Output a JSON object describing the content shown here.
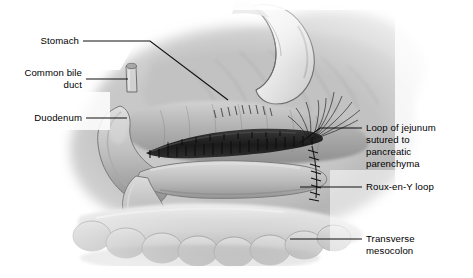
{
  "figure": {
    "kind": "medical-illustration",
    "palette": {
      "background": "#ffffff",
      "tissue_light": "#e2e2e2",
      "tissue_mid": "#b6b6b6",
      "tissue_dark": "#8d8d8d",
      "tissue_shadow": "#6b6b6b",
      "anastomosis_dark": "#1f1f1f",
      "stomach_highlight": "#f4f4f4",
      "outline": "#5a5a5a",
      "leader_line": "#111111",
      "label_text": "#000000"
    }
  },
  "labels": {
    "stomach": "Stomach",
    "common_bile_duct_line1": "Common bile",
    "common_bile_duct_line2": "duct",
    "duodenum": "Duodenum",
    "jejunum_line1": "Loop of jejunum",
    "jejunum_line2": "sutured to",
    "jejunum_line3": "pancreatic",
    "jejunum_line4": "parenchyma",
    "roux_en_y": "Roux-en-Y loop",
    "mesocolon_line1": "Transverse",
    "mesocolon_line2": "mesocolon"
  }
}
